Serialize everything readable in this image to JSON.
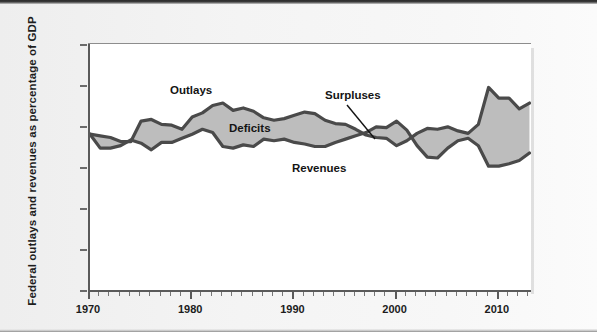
{
  "figure": {
    "y_axis_title": "Federal outlays and revenues as percentage of GDP"
  },
  "annotations": {
    "outlays": "Outlays",
    "deficits": "Deficits",
    "revenues": "Revenues",
    "surpluses": "Surpluses"
  },
  "chart_data": {
    "type": "area",
    "title": "",
    "xlabel": "",
    "ylabel": "Federal outlays and revenues as percentage of GDP",
    "xlim": [
      1970,
      2013
    ],
    "ylim": [
      0.0,
      30.0
    ],
    "yticks": [
      "0.0%",
      "5.0%",
      "10.0%",
      "15.0%",
      "20.0%",
      "25.0%",
      "30.0%"
    ],
    "ytick_values": [
      0.0,
      5.0,
      10.0,
      15.0,
      20.0,
      25.0,
      30.0
    ],
    "xticks": [
      "1970",
      "1980",
      "1990",
      "2000",
      "2010"
    ],
    "xtick_values": [
      1970,
      1980,
      1990,
      2000,
      2010
    ],
    "xtick_minor_interval": 1,
    "grid": false,
    "legend_position": "inline-annotations",
    "fill_between": {
      "label_above": "Deficits",
      "label_below": "Surpluses",
      "fill_color": "#bdbdbd",
      "line_color": "#4a4a4a"
    },
    "x": [
      1970,
      1971,
      1972,
      1973,
      1974,
      1975,
      1976,
      1977,
      1978,
      1979,
      1980,
      1981,
      1982,
      1983,
      1984,
      1985,
      1986,
      1987,
      1988,
      1989,
      1990,
      1991,
      1992,
      1993,
      1994,
      1995,
      1996,
      1997,
      1998,
      1999,
      2000,
      2001,
      2002,
      2003,
      2004,
      2005,
      2006,
      2007,
      2008,
      2009,
      2010,
      2011,
      2012,
      2013
    ],
    "series": [
      {
        "name": "Outlays",
        "units": "percent of GDP",
        "values": [
          19.0,
          18.8,
          18.6,
          18.1,
          18.1,
          20.6,
          20.8,
          20.2,
          20.1,
          19.6,
          21.1,
          21.6,
          22.5,
          22.8,
          21.9,
          22.2,
          21.8,
          21.0,
          20.7,
          20.9,
          21.3,
          21.7,
          21.5,
          20.7,
          20.3,
          20.2,
          19.6,
          18.9,
          18.6,
          18.5,
          17.6,
          18.2,
          19.1,
          19.7,
          19.6,
          19.9,
          19.4,
          19.1,
          20.2,
          24.7,
          23.4,
          23.4,
          22.1,
          22.8
        ]
      },
      {
        "name": "Revenues",
        "units": "percent of GDP",
        "values": [
          19.0,
          17.3,
          17.3,
          17.6,
          18.3,
          17.9,
          17.1,
          18.0,
          18.0,
          18.5,
          19.0,
          19.6,
          19.2,
          17.5,
          17.3,
          17.7,
          17.5,
          18.4,
          18.2,
          18.4,
          18.0,
          17.8,
          17.5,
          17.5,
          18.0,
          18.4,
          18.8,
          19.2,
          19.9,
          19.8,
          20.6,
          19.5,
          17.6,
          16.2,
          16.1,
          17.3,
          18.2,
          18.5,
          17.6,
          15.1,
          15.1,
          15.4,
          15.8,
          16.7
        ]
      }
    ]
  }
}
